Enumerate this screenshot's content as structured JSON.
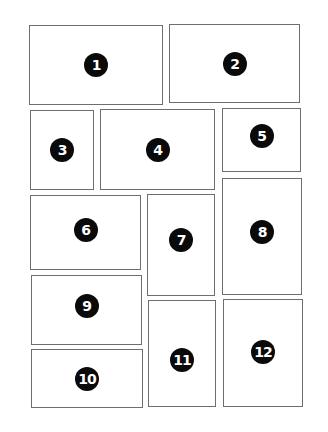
{
  "diagram": {
    "panels": [
      {
        "label": "1",
        "x": 29,
        "y": 25,
        "w": 134,
        "h": 80
      },
      {
        "label": "2",
        "x": 169,
        "y": 24,
        "w": 131,
        "h": 79
      },
      {
        "label": "3",
        "x": 30,
        "y": 110,
        "w": 64,
        "h": 80
      },
      {
        "label": "4",
        "x": 100,
        "y": 109,
        "w": 115,
        "h": 81
      },
      {
        "label": "5",
        "x": 222,
        "y": 108,
        "w": 79,
        "h": 64
      },
      {
        "label": "6",
        "x": 30,
        "y": 195,
        "w": 111,
        "h": 75
      },
      {
        "label": "7",
        "x": 147,
        "y": 194,
        "w": 68,
        "h": 102
      },
      {
        "label": "8",
        "x": 222,
        "y": 178,
        "w": 80,
        "h": 117
      },
      {
        "label": "9",
        "x": 31,
        "y": 275,
        "w": 111,
        "h": 70
      },
      {
        "label": "10",
        "x": 31,
        "y": 349,
        "w": 112,
        "h": 59
      },
      {
        "label": "11",
        "x": 148,
        "y": 300,
        "w": 68,
        "h": 107
      },
      {
        "label": "12",
        "x": 223,
        "y": 299,
        "w": 80,
        "h": 108
      }
    ],
    "colors": {
      "border": "#6e6e6e",
      "badge": "#0a0a0a",
      "badge_text": "#ffffff",
      "background": "#ffffff"
    }
  }
}
